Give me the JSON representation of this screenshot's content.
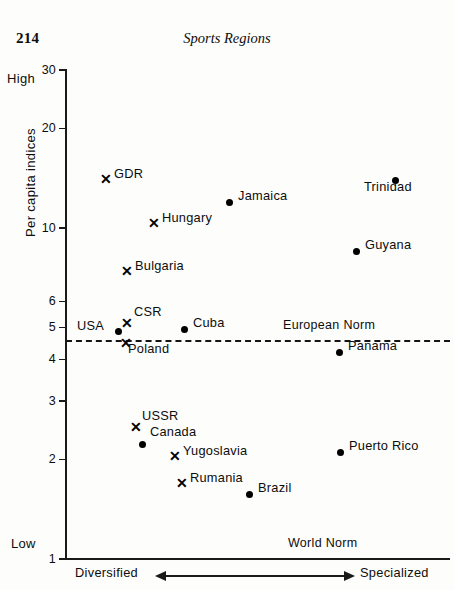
{
  "page": {
    "number": "214",
    "running_head": "Sports Regions"
  },
  "chart_data": {
    "type": "scatter",
    "title": "Sports Regions",
    "xlabel": "",
    "ylabel": "Per capita indices",
    "yscale": "log",
    "ylim": [
      1,
      30
    ],
    "yticks": [
      {
        "label": "30",
        "value": 30
      },
      {
        "label": "20",
        "value": 20
      },
      {
        "label": "10",
        "value": 10
      },
      {
        "label": "6",
        "value": 6
      },
      {
        "label": "5",
        "value": 5
      },
      {
        "label": "4",
        "value": 4
      },
      {
        "label": "3",
        "value": 3
      },
      {
        "label": "2",
        "value": 2
      },
      {
        "label": "1",
        "value": 1
      }
    ],
    "axis_captions": {
      "y_top": "High",
      "y_bottom": "Low",
      "x_left": "Diversified",
      "x_right": "Specialized"
    },
    "grid": false,
    "legend": "none",
    "annotations": [
      {
        "name": "european-norm",
        "text": "European Norm",
        "value": 4.55,
        "style": "dashed-horizontal-line"
      },
      {
        "name": "world-norm",
        "text": "World Norm",
        "value": 1,
        "style": "axis-line"
      }
    ],
    "marker_types": {
      "cross": "x-marker (socialist / European countries)",
      "dot": "filled-circle (other countries)"
    },
    "points": [
      {
        "name": "GDR",
        "marker": "cross",
        "y": 14.3,
        "x_px": 105,
        "y_px": 179,
        "label_dx": 9,
        "label_dy": -6
      },
      {
        "name": "Jamaica",
        "marker": "dot",
        "y": 12.4,
        "x_px": 229,
        "y_px": 202,
        "label_dx": 9,
        "label_dy": -7
      },
      {
        "name": "Trinidad",
        "marker": "dot",
        "y": 14.3,
        "x_px": 395,
        "y_px": 180,
        "label_dx": -31,
        "label_dy": 6
      },
      {
        "name": "Hungary",
        "marker": "cross",
        "y": 10.2,
        "x_px": 153,
        "y_px": 223,
        "label_dx": 9,
        "label_dy": -6
      },
      {
        "name": "Guyana",
        "marker": "dot",
        "y": 7.6,
        "x_px": 356,
        "y_px": 251,
        "label_dx": 9,
        "label_dy": -7
      },
      {
        "name": "Bulgaria",
        "marker": "cross",
        "y": 6.5,
        "x_px": 126,
        "y_px": 271,
        "label_dx": 9,
        "label_dy": -6
      },
      {
        "name": "CSR",
        "marker": "cross",
        "y": 4.95,
        "x_px": 126,
        "y_px": 323,
        "label_dx": 8,
        "label_dy": -12
      },
      {
        "name": "USA",
        "marker": "dot",
        "y": 4.7,
        "x_px": 118,
        "y_px": 331,
        "label_dx": -41,
        "label_dy": -6
      },
      {
        "name": "Cuba",
        "marker": "dot",
        "y": 4.8,
        "x_px": 184,
        "y_px": 329,
        "label_dx": 9,
        "label_dy": -7
      },
      {
        "name": "Poland",
        "marker": "cross",
        "y": 4.35,
        "x_px": 125,
        "y_px": 343,
        "label_dx": 3,
        "label_dy": 5
      },
      {
        "name": "Panama",
        "marker": "dot",
        "y": 4.1,
        "x_px": 339,
        "y_px": 352,
        "label_dx": 9,
        "label_dy": -7
      },
      {
        "name": "USSR",
        "marker": "cross",
        "y": 2.55,
        "x_px": 135,
        "y_px": 427,
        "label_dx": 7,
        "label_dy": -12
      },
      {
        "name": "Canada",
        "marker": "dot",
        "y": 2.25,
        "x_px": 142,
        "y_px": 444,
        "label_dx": 8,
        "label_dy": -13
      },
      {
        "name": "Yugoslavia",
        "marker": "cross",
        "y": 2.0,
        "x_px": 174,
        "y_px": 456,
        "label_dx": 9,
        "label_dy": -6
      },
      {
        "name": "Puerto Rico",
        "marker": "dot",
        "y": 2.1,
        "x_px": 340,
        "y_px": 452,
        "label_dx": 9,
        "label_dy": -7
      },
      {
        "name": "Rumania",
        "marker": "cross",
        "y": 1.75,
        "x_px": 181,
        "y_px": 483,
        "label_dx": 9,
        "label_dy": -6
      },
      {
        "name": "Brazil",
        "marker": "dot",
        "y": 1.55,
        "x_px": 249,
        "y_px": 494,
        "label_dx": 9,
        "label_dy": -7
      }
    ]
  },
  "colors": {
    "ink": "#0d0d0d",
    "paper": "#fdfdfc"
  }
}
